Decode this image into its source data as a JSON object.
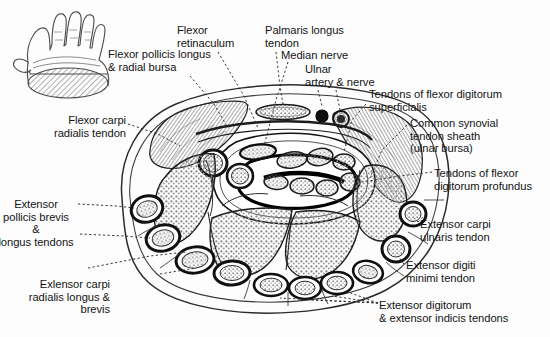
{
  "figure": {
    "type": "anatomical-cross-section",
    "background_color": "#fdfdfd",
    "ink_color": "#141414"
  },
  "key_diagram": {
    "name": "hand-orientation-key",
    "description": "Palmar view of left hand with hatched oval at the wrist marking the level of the section"
  },
  "labels": [
    {
      "id": "flexor-pollicis-longus",
      "text": "Flexor pollicis longus\n& radial bursa",
      "align": "left",
      "x": 108,
      "y": 48
    },
    {
      "id": "flexor-retinaculum",
      "text": "Flexor\nretinaculum",
      "align": "left",
      "x": 177,
      "y": 24
    },
    {
      "id": "palmaris-longus-tendon",
      "text": "Palmaris longus\ntendon",
      "align": "left",
      "x": 265,
      "y": 24
    },
    {
      "id": "median-nerve",
      "text": "Median nerve",
      "align": "left",
      "x": 281,
      "y": 49
    },
    {
      "id": "ulnar-artery-nerve",
      "text": "Ulnar\nartery & nerve",
      "align": "left",
      "x": 305,
      "y": 63
    },
    {
      "id": "tendons-flexor-digitorum-superficialis",
      "text": "Tendons of flexor digitorum\nsuperficialis",
      "align": "left",
      "x": 369,
      "y": 88
    },
    {
      "id": "common-synovial-tendon-sheath",
      "text": "Common synovial\ntendon sheath\n(ulnar bursa)",
      "align": "left",
      "x": 410,
      "y": 117
    },
    {
      "id": "tendons-flexor-digitorum-profundus",
      "text": "Tendons of flexor\ndigitorum profundus",
      "align": "left",
      "x": 434,
      "y": 167
    },
    {
      "id": "extensor-carpi-ulnaris-tendon",
      "text": "Extensor carpi\nulnaris tendon",
      "align": "left",
      "x": 420,
      "y": 218
    },
    {
      "id": "extensor-digiti-minimi-tendon",
      "text": "Extensor digiti\nminimi tendon",
      "align": "left",
      "x": 406,
      "y": 259
    },
    {
      "id": "extensor-digitorum-indicis-tendons",
      "text": "Extensor digitorum\n& extensor indicis tendons",
      "align": "left",
      "x": 379,
      "y": 299
    },
    {
      "id": "flexor-carpi-radialis-tendon",
      "text": "Flexor carpi\nradialis tendon",
      "align": "right",
      "x": 32,
      "y": 114
    },
    {
      "id": "extensor-pollicis-brevis-longus",
      "text": "Extensor\npollicis brevis\n&\nlongus tendons",
      "align": "center",
      "x": 2,
      "y": 198
    },
    {
      "id": "extensor-carpi-radialis-longus-brevis",
      "text": "Exlensor carpi\nradialis longus &\nbrevis",
      "align": "right",
      "x": 75,
      "y": 278
    }
  ]
}
